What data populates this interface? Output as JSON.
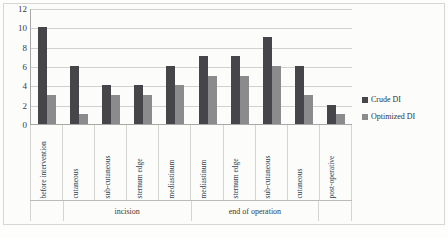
{
  "chart_data": {
    "type": "bar",
    "title": "",
    "xlabel": "",
    "ylabel": "",
    "ylim": [
      0,
      12
    ],
    "yticks": [
      0,
      2,
      4,
      6,
      8,
      10,
      12
    ],
    "grid": true,
    "legend_position": "right",
    "categories": [
      "before intervention",
      "cutaneous",
      "sub-cutaneous",
      "sternum edge",
      "mediastinum",
      "mediastinum",
      "sternum edge",
      "sub-cutaneous",
      "cutaneous",
      "post-operative"
    ],
    "series": [
      {
        "name": "Crude DI",
        "color": "#46464a",
        "values": [
          10,
          6,
          4,
          4,
          6,
          7,
          7,
          9,
          6,
          2
        ]
      },
      {
        "name": "Optimized DI",
        "color": "#8b8b8d",
        "values": [
          3,
          1,
          3,
          3,
          4,
          5,
          5,
          6,
          3,
          1
        ]
      }
    ],
    "groups": [
      {
        "label": "",
        "span": 1
      },
      {
        "label": "incision",
        "span": 4
      },
      {
        "label": "end of operation",
        "span": 4
      },
      {
        "label": "",
        "span": 1
      }
    ]
  },
  "legend": {
    "items": [
      {
        "label": "Crude DI",
        "color": "#46464a"
      },
      {
        "label": "Optimized DI",
        "color": "#8b8b8d"
      }
    ]
  }
}
